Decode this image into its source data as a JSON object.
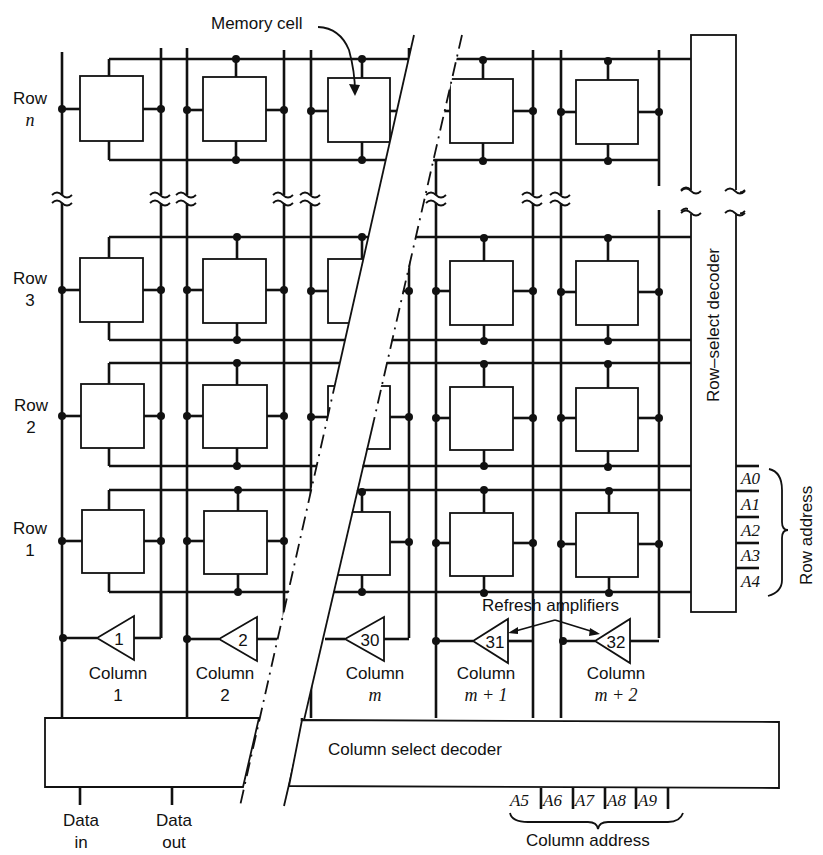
{
  "figure": {
    "annotations": {
      "memory_cell": "Memory cell",
      "refresh_amplifiers": "Refresh amplifiers",
      "row_select_decoder": "Row–select decoder",
      "column_select_decoder": "Column select decoder",
      "row_address": "Row address",
      "column_address": "Column address"
    },
    "rows": [
      {
        "label_line1": "Row",
        "label_line2": "n",
        "italic": true
      },
      {
        "label_line1": "Row",
        "label_line2": "3",
        "italic": false
      },
      {
        "label_line1": "Row",
        "label_line2": "2",
        "italic": false
      },
      {
        "label_line1": "Row",
        "label_line2": "1",
        "italic": false
      }
    ],
    "columns": [
      {
        "label_line1": "Column",
        "label_line2": "1",
        "amplifier": "1"
      },
      {
        "label_line1": "Column",
        "label_line2": "2",
        "amplifier": "2"
      },
      {
        "label_line1": "Column",
        "label_line2": "m",
        "amplifier": "30"
      },
      {
        "label_line1": "Column",
        "label_line2": "m + 1",
        "amplifier": "31"
      },
      {
        "label_line1": "Column",
        "label_line2": "m + 2",
        "amplifier": "32"
      }
    ],
    "row_address_lines": [
      "A0",
      "A1",
      "A2",
      "A3",
      "A4"
    ],
    "column_address_lines": [
      "A5",
      "A6",
      "A7",
      "A8",
      "A9"
    ],
    "io": {
      "data_in_line1": "Data",
      "data_in_line2": "in",
      "data_out_line1": "Data",
      "data_out_line2": "out"
    }
  }
}
